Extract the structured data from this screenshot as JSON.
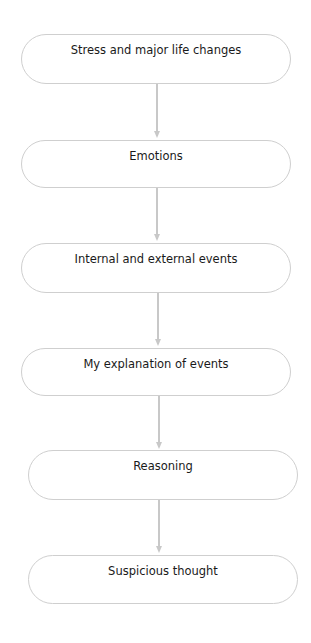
{
  "diagram": {
    "type": "vertical-flowchart",
    "colors": {
      "node_border": "#cfcfcf",
      "connector": "#c8c8c8",
      "text": "#1a1a1a",
      "background": "#ffffff"
    },
    "nodes": [
      {
        "id": "n1",
        "label": "Stress and major life changes"
      },
      {
        "id": "n2",
        "label": "Emotions"
      },
      {
        "id": "n3",
        "label": "Internal and external events"
      },
      {
        "id": "n4",
        "label": "My explanation of events"
      },
      {
        "id": "n5",
        "label": "Reasoning"
      },
      {
        "id": "n6",
        "label": "Suspicious thought"
      }
    ],
    "edges": [
      {
        "from": "n1",
        "to": "n2"
      },
      {
        "from": "n2",
        "to": "n3"
      },
      {
        "from": "n3",
        "to": "n4"
      },
      {
        "from": "n4",
        "to": "n5"
      },
      {
        "from": "n5",
        "to": "n6"
      }
    ]
  }
}
